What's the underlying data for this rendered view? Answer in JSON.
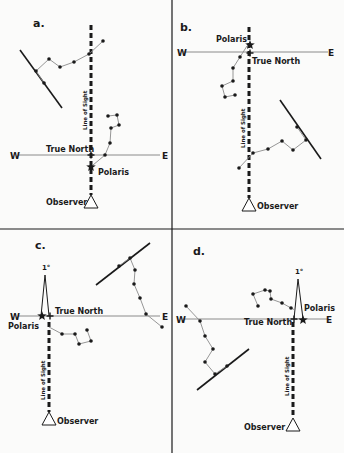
{
  "figure": {
    "width": 344,
    "height": 453,
    "colors": {
      "ink": "#1a1a1a",
      "thin": "#8a8a8a",
      "background": "#fbfbfa"
    },
    "dividers": {
      "vertical_x": 172,
      "horizontal_y": 229
    }
  },
  "panels": [
    {
      "id": "a",
      "label": "a.",
      "label_pos": [
        33,
        27
      ],
      "ew_line": {
        "y": 155,
        "x1": 18,
        "x2": 160
      },
      "west": {
        "text": "W",
        "pos": [
          10,
          159
        ]
      },
      "east": {
        "text": "E",
        "pos": [
          162,
          159
        ]
      },
      "true_north": {
        "text": "True North",
        "pos": [
          46,
          152
        ],
        "cross": [
          91,
          155
        ]
      },
      "polaris": {
        "text": "Polaris",
        "pos": [
          98,
          175
        ],
        "star": [
          91,
          167
        ]
      },
      "sightline": {
        "x": 91,
        "y1": 25,
        "y2": 195
      },
      "sight_text": {
        "text": "Line of Sight",
        "pos": [
          87,
          130
        ]
      },
      "observer": {
        "text": "Observer",
        "pos": [
          46,
          205
        ],
        "tri": [
          91,
          195,
          84,
          208,
          98,
          208
        ]
      },
      "big_dipper": [
        [
          103,
          41
        ],
        [
          89,
          54
        ],
        [
          74,
          62
        ],
        [
          60,
          67
        ],
        [
          49,
          59
        ],
        [
          36,
          71
        ],
        [
          44,
          83
        ]
      ],
      "big_line": [
        20,
        50,
        62,
        108
      ],
      "little_dipper": [
        [
          93,
          165
        ],
        [
          105,
          155
        ],
        [
          110,
          143
        ],
        [
          111,
          128
        ],
        [
          119,
          125
        ],
        [
          117,
          115
        ],
        [
          108,
          116
        ]
      ],
      "one_degree": null
    },
    {
      "id": "b",
      "label": "b.",
      "label_pos": [
        180,
        31
      ],
      "ew_line": {
        "y": 52,
        "x1": 183,
        "x2": 328
      },
      "west": {
        "text": "W",
        "pos": [
          177,
          56
        ]
      },
      "east": {
        "text": "E",
        "pos": [
          328,
          56
        ]
      },
      "true_north": {
        "text": "True North",
        "pos": [
          252,
          64
        ],
        "cross": [
          250,
          53
        ]
      },
      "polaris": {
        "text": "Polaris",
        "pos": [
          216,
          42
        ],
        "star": [
          250,
          45
        ]
      },
      "sightline": {
        "x": 249,
        "y1": 27,
        "y2": 198
      },
      "sight_text": {
        "text": "Line of Sight",
        "pos": [
          245,
          148
        ]
      },
      "observer": {
        "text": "Observer",
        "pos": [
          257,
          209
        ],
        "tri": [
          249,
          198,
          242,
          211,
          256,
          211
        ]
      },
      "big_dipper": [
        [
          239,
          168
        ],
        [
          253,
          153
        ],
        [
          268,
          149
        ],
        [
          282,
          141
        ],
        [
          293,
          150
        ],
        [
          306,
          140
        ],
        [
          297,
          127
        ]
      ],
      "big_line": [
        280,
        100,
        321,
        159
      ],
      "little_dipper": [
        [
          247,
          46
        ],
        [
          240,
          57
        ],
        [
          233,
          68
        ],
        [
          233,
          81
        ],
        [
          222,
          86
        ],
        [
          225,
          97
        ],
        [
          235,
          95
        ]
      ],
      "one_degree": null
    },
    {
      "id": "c",
      "label": "c.",
      "label_pos": [
        35,
        249
      ],
      "ew_line": {
        "y": 316,
        "x1": 18,
        "x2": 160
      },
      "west": {
        "text": "W",
        "pos": [
          10,
          320
        ]
      },
      "east": {
        "text": "E",
        "pos": [
          162,
          320
        ]
      },
      "true_north": {
        "text": "True North",
        "pos": [
          55,
          314
        ],
        "cross": [
          50,
          316
        ]
      },
      "polaris": {
        "text": "Polaris",
        "pos": [
          8,
          329
        ],
        "star": [
          42,
          316
        ]
      },
      "sightline": {
        "x": 49,
        "y1": 322,
        "y2": 412
      },
      "sight_text": {
        "text": "Line of Sight",
        "pos": [
          45,
          400
        ]
      },
      "observer": {
        "text": "Observer",
        "pos": [
          57,
          424
        ],
        "tri": [
          49,
          412,
          42,
          425,
          56,
          425
        ]
      },
      "big_dipper": [
        [
          162,
          327
        ],
        [
          146,
          314
        ],
        [
          140,
          298
        ],
        [
          134,
          284
        ],
        [
          135,
          270
        ],
        [
          130,
          258
        ],
        [
          119,
          266
        ]
      ],
      "big_line": [
        96,
        285,
        150,
        243
      ],
      "little_dipper": [
        [
          49,
          327
        ],
        [
          62,
          334
        ],
        [
          75,
          334
        ],
        [
          79,
          344
        ],
        [
          91,
          341
        ],
        [
          87,
          330
        ]
      ],
      "one_degree": {
        "text": "1°",
        "pos": [
          42,
          270
        ],
        "apex": [
          45,
          275
        ],
        "left": [
          41,
          316
        ],
        "right": [
          49,
          316
        ]
      }
    },
    {
      "id": "d",
      "label": "d.",
      "label_pos": [
        193,
        255
      ],
      "ew_line": {
        "y": 319,
        "x1": 183,
        "x2": 327
      },
      "west": {
        "text": "W",
        "pos": [
          176,
          323
        ]
      },
      "east": {
        "text": "E",
        "pos": [
          326,
          323
        ]
      },
      "true_north": {
        "text": "True North",
        "pos": [
          244,
          325
        ],
        "cross": [
          294,
          319
        ]
      },
      "polaris": {
        "text": "Polaris",
        "pos": [
          304,
          311
        ],
        "star": [
          303,
          320
        ]
      },
      "sightline": {
        "x": 293,
        "y1": 322,
        "y2": 418
      },
      "sight_text": {
        "text": "Line of Sight",
        "pos": [
          289,
          396
        ]
      },
      "observer": {
        "text": "Observer",
        "pos": [
          244,
          430
        ],
        "tri": [
          293,
          418,
          286,
          431,
          300,
          431
        ]
      },
      "big_dipper": [
        [
          186,
          306
        ],
        [
          200,
          321
        ],
        [
          205,
          336
        ],
        [
          213,
          349
        ],
        [
          205,
          362
        ],
        [
          215,
          374
        ],
        [
          227,
          366
        ]
      ],
      "big_line": [
        197,
        390,
        249,
        349
      ],
      "little_dipper": [
        [
          295,
          310
        ],
        [
          291,
          308
        ],
        [
          282,
          303
        ],
        [
          271,
          299
        ],
        [
          270,
          291
        ],
        [
          265,
          290
        ],
        [
          253,
          294
        ],
        [
          258,
          306
        ]
      ],
      "one_degree": {
        "text": "1°",
        "pos": [
          295,
          274
        ],
        "apex": [
          298,
          279
        ],
        "left": [
          294,
          319
        ],
        "right": [
          303,
          319
        ]
      }
    }
  ]
}
